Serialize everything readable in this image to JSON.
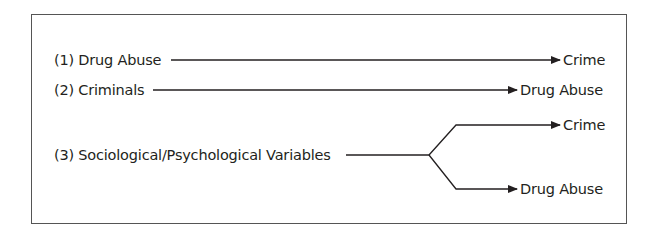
{
  "diagram": {
    "models": [
      {
        "label": "(1) Drug Abuse",
        "targets": [
          "Crime"
        ]
      },
      {
        "label": "(2) Criminals",
        "targets": [
          "Drug Abuse"
        ]
      },
      {
        "label": "(3) Sociological/Psychological Variables",
        "targets": [
          "Crime",
          "Drug Abuse"
        ]
      }
    ],
    "colors": {
      "line": "#231f20",
      "border": "#555555"
    }
  }
}
